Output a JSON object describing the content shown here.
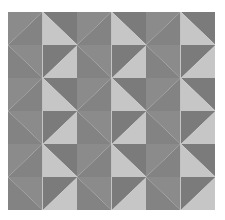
{
  "pattern": {
    "name": "pinwheel-quilt",
    "rows": 6,
    "columns": 6,
    "colors": {
      "light": "#c6c6c6",
      "dark": "#7b7b7b",
      "mid": "#8b8b8b",
      "mid_dark": "#838383"
    },
    "unit": [
      [
        {
          "diagonal": "bl-tr",
          "a": "mid",
          "b": "mid_dark"
        },
        {
          "diagonal": "tl-br",
          "a": "dark",
          "b": "light"
        }
      ],
      [
        {
          "diagonal": "tl-br",
          "a": "mid",
          "b": "mid_dark"
        },
        {
          "diagonal": "bl-tr",
          "a": "dark",
          "b": "light"
        }
      ]
    ]
  }
}
